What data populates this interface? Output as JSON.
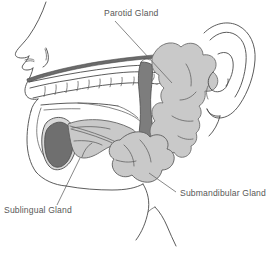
{
  "figure": {
    "background_color": "#ffffff",
    "width": 276,
    "height": 258
  },
  "palette": {
    "gland_light_gray": "#c9c9c9",
    "gland_light_gray_stroke": "#7a7a7a",
    "ramus_dark_gray": "#7d7d7d",
    "ramus_dark_stroke": "#555555",
    "tongue_dark_gray": "#6f6f6f",
    "palate_band_gray": "#6b6b6b",
    "outline_stroke": "#4a4a4a",
    "label_text_color": "#585858",
    "leader_line_color": "#6a6a6a"
  },
  "labels": [
    {
      "id": "parotid",
      "text": "Parotid Gland",
      "x": 104,
      "y": 16,
      "anchor": "start"
    },
    {
      "id": "submandibular",
      "text": "Submandibular Gland",
      "x": 180,
      "y": 196,
      "anchor": "start"
    },
    {
      "id": "sublingual",
      "text": "Sublingual Gland",
      "x": 4,
      "y": 213,
      "anchor": "start"
    }
  ],
  "structures": [
    {
      "id": "parotid-gland",
      "name": "Parotid Gland",
      "fill": "#c9c9c9"
    },
    {
      "id": "submandibular-gland",
      "name": "Submandibular Gland",
      "fill": "#c9c9c9"
    },
    {
      "id": "sublingual-gland",
      "name": "Sublingual Gland",
      "fill": "#c9c9c9"
    },
    {
      "id": "mandibular-ramus",
      "name": "Mandibular Ramus",
      "fill": "#7d7d7d"
    },
    {
      "id": "tongue",
      "name": "Tongue",
      "fill": "#6f6f6f"
    },
    {
      "id": "hard-palate",
      "name": "Hard Palate",
      "fill": "#6b6b6b"
    },
    {
      "id": "ear",
      "name": "Ear",
      "fill": "none"
    },
    {
      "id": "nose",
      "name": "Nose",
      "fill": "none"
    },
    {
      "id": "upper-teeth",
      "name": "Upper Teeth",
      "fill": "none"
    },
    {
      "id": "face-profile",
      "name": "Face Profile",
      "fill": "none"
    }
  ]
}
